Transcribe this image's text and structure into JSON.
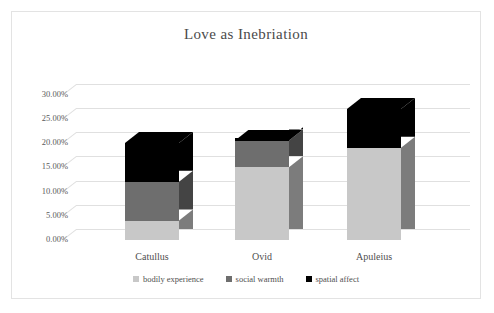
{
  "frame": {
    "border_color": "#e3e3e3",
    "background": "#ffffff"
  },
  "chart_data": {
    "type": "bar",
    "subtype": "stacked-column-3d",
    "title": "Love as Inebriation",
    "subtitle": "",
    "xlabel": "",
    "ylabel": "",
    "categories": [
      "Catullus",
      "Ovid",
      "Apuleius"
    ],
    "series": [
      {
        "name": "bodily experience",
        "color": "#c8c8c8",
        "values": [
          4.0,
          15.0,
          19.0
        ]
      },
      {
        "name": "social warmth",
        "color": "#6e6e6e",
        "values": [
          8.0,
          5.5,
          0.0
        ]
      },
      {
        "name": "spatial affect",
        "color": "#000000",
        "values": [
          8.0,
          0.5,
          8.0
        ]
      }
    ],
    "totals": [
      20.0,
      20.5,
      27.0
    ],
    "ylim": [
      0,
      30
    ],
    "ytick_values": [
      0,
      5,
      10,
      15,
      20,
      25,
      30
    ],
    "ytick_labels": [
      "0.00%",
      "5.00%",
      "10.00%",
      "15.00%",
      "20.00%",
      "25.00%",
      "30.00%"
    ],
    "grid": true,
    "grid_color": "#e0e0e0",
    "legend_position": "bottom",
    "legend_entries": [
      "bodily experience",
      "social warmth",
      "spatial affect"
    ],
    "value_unit": "percent"
  }
}
